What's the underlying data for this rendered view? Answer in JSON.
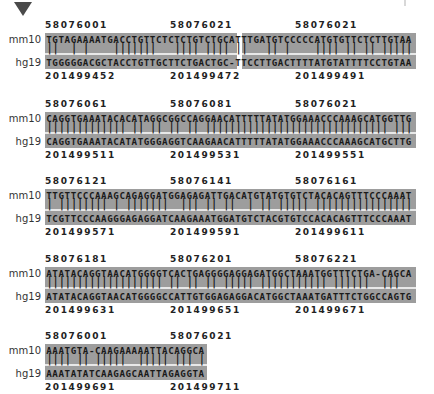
{
  "marker": {
    "icon": "triangle-down-icon"
  },
  "labels": {
    "query": "mm10",
    "target": "hg19"
  },
  "colors": {
    "sequence_bg": "#9d9d9d",
    "separator": "#e8e8e8",
    "text": "#1a1a1a"
  },
  "blocks": [
    {
      "top_coords": [
        {
          "value": "58076001",
          "x": 45
        },
        {
          "value": "58076021",
          "x": 170
        },
        {
          "value": "58076021",
          "x": 295
        }
      ],
      "mm10": "TGTAGAAAATGACCTGTTCTCTCTGTCTGCATTTGATGTCCCCCATGTGTTCTCTTGTAA",
      "hg19": "TGGGGGACGCTACCTGTTGCTTCTGACTGC-TTCCTTGACTTTTATGTATTTTCCTGTAA",
      "gap_index": 30,
      "bottom_coords": [
        {
          "value": "201499452",
          "x": 45
        },
        {
          "value": "201499472",
          "x": 170
        },
        {
          "value": "201499491",
          "x": 295
        }
      ]
    },
    {
      "top_coords": [
        {
          "value": "58076061",
          "x": 45
        },
        {
          "value": "58076081",
          "x": 170
        },
        {
          "value": "58076021",
          "x": 295
        }
      ],
      "mm10": "CAGGTGAAATACACATAGGCGGCCAGGAACATTTTTATATGGAAACCCAAAGCATGGTTG",
      "hg19": "CAGGTGAAATACATATGGGAGGTCAAGAACATTTTTATATGGAAACCCAAAGCATGCTTG",
      "gap_index": null,
      "bottom_coords": [
        {
          "value": "201499511",
          "x": 45
        },
        {
          "value": "201499531",
          "x": 170
        },
        {
          "value": "201499551",
          "x": 295
        }
      ]
    },
    {
      "top_coords": [
        {
          "value": "58076121",
          "x": 45
        },
        {
          "value": "58076141",
          "x": 170
        },
        {
          "value": "58076161",
          "x": 295
        }
      ],
      "mm10": "TTGTTCCCAAAGCAGAGGATGGAGAGATTGACATGTATGTGTCTACACAGTTTCCCAAAT",
      "hg19": "TCGTTCCCAAGGGAGAGGATCAAGAAATGGATGTCTACGTGTCCACACAGTTTCCCAAAT",
      "gap_index": null,
      "bottom_coords": [
        {
          "value": "201499571",
          "x": 45
        },
        {
          "value": "201499591",
          "x": 170
        },
        {
          "value": "201499611",
          "x": 295
        }
      ]
    },
    {
      "top_coords": [
        {
          "value": "58076181",
          "x": 45
        },
        {
          "value": "58076201",
          "x": 170
        },
        {
          "value": "58076221",
          "x": 295
        }
      ],
      "mm10": "ATATACAGGTAACATGGGGTCACTGAGGGGAGGAGATGGCTAAATGGTTTCTGA-CAGCA",
      "hg19": "ATATACAGGTAACATGGGGCCATTGTGGAGAGGACATGGCTAAATGATTTCTGGCCAGTG",
      "gap_index": null,
      "bottom_coords": [
        {
          "value": "201499631",
          "x": 45
        },
        {
          "value": "201499651",
          "x": 170
        },
        {
          "value": "201499671",
          "x": 295
        }
      ]
    },
    {
      "top_coords": [
        {
          "value": "58076001",
          "x": 45
        },
        {
          "value": "58076021",
          "x": 170
        }
      ],
      "mm10": "AAATGTA-CAAGAAAAATTACAGGCA",
      "hg19": "AAATATATCAAGAGCAATTAGAGGTA",
      "gap_index": null,
      "bottom_coords": [
        {
          "value": "201499691",
          "x": 45
        },
        {
          "value": "201499711",
          "x": 170
        }
      ]
    }
  ]
}
